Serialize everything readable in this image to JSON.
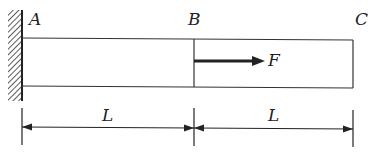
{
  "diagram": {
    "type": "cantilever-bar",
    "labels": {
      "point_a": "A",
      "point_b": "B",
      "point_c": "C",
      "force": "F",
      "length_ab": "L",
      "length_bc": "L"
    },
    "colors": {
      "stroke": "#222222",
      "background": "#ffffff"
    }
  }
}
